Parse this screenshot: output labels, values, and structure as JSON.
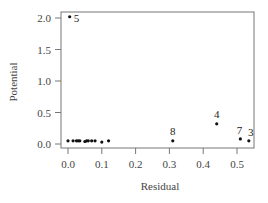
{
  "chart_data": {
    "type": "scatter",
    "title": "",
    "xlabel": "Residual",
    "ylabel": "Potential",
    "xlim": [
      -0.02,
      0.55
    ],
    "ylim": [
      -0.05,
      2.1
    ],
    "xticks": [
      0.0,
      0.1,
      0.2,
      0.3,
      0.4,
      0.5
    ],
    "xtick_labels": [
      "0.0",
      "0.1",
      "0.2",
      "0.3",
      "0.4",
      "0.5"
    ],
    "yticks": [
      0.0,
      0.5,
      1.0,
      1.5,
      2.0
    ],
    "ytick_labels": [
      "0.0",
      "0.5",
      "1.0",
      "1.5",
      "2.0"
    ],
    "grid": false,
    "legend": null,
    "points": [
      {
        "x": 0.005,
        "y": 2.02,
        "label": "5"
      },
      {
        "x": 0.0,
        "y": 0.05,
        "label": ""
      },
      {
        "x": 0.015,
        "y": 0.05,
        "label": ""
      },
      {
        "x": 0.025,
        "y": 0.05,
        "label": ""
      },
      {
        "x": 0.03,
        "y": 0.05,
        "label": ""
      },
      {
        "x": 0.035,
        "y": 0.05,
        "label": ""
      },
      {
        "x": 0.05,
        "y": 0.04,
        "label": ""
      },
      {
        "x": 0.055,
        "y": 0.05,
        "label": ""
      },
      {
        "x": 0.06,
        "y": 0.05,
        "label": ""
      },
      {
        "x": 0.07,
        "y": 0.05,
        "label": ""
      },
      {
        "x": 0.08,
        "y": 0.05,
        "label": ""
      },
      {
        "x": 0.1,
        "y": 0.03,
        "label": ""
      },
      {
        "x": 0.12,
        "y": 0.05,
        "label": ""
      },
      {
        "x": 0.31,
        "y": 0.05,
        "label": "8"
      },
      {
        "x": 0.44,
        "y": 0.32,
        "label": "4"
      },
      {
        "x": 0.51,
        "y": 0.08,
        "label": "7"
      },
      {
        "x": 0.535,
        "y": 0.05,
        "label": "3"
      }
    ]
  },
  "colors": {
    "axis": "#666666",
    "point": "#111111",
    "text": "#444444"
  }
}
